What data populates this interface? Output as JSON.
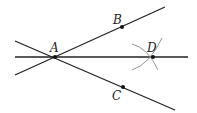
{
  "diagram": {
    "type": "geometry-construction",
    "colors": {
      "line": "#222222",
      "arc": "#888888",
      "point": "#111111",
      "background": "#ffffff"
    },
    "points": [
      {
        "id": "A",
        "label": "A",
        "x": 55,
        "y": 57,
        "lx": 50,
        "ly": 52
      },
      {
        "id": "B",
        "label": "B",
        "x": 122,
        "y": 27,
        "lx": 113,
        "ly": 24
      },
      {
        "id": "C",
        "label": "C",
        "x": 123,
        "y": 87,
        "lx": 112,
        "ly": 100
      },
      {
        "id": "D",
        "label": "D",
        "x": 153,
        "y": 57,
        "lx": 147,
        "ly": 52
      }
    ],
    "lines": [
      {
        "id": "line-AD",
        "x1": 15,
        "y1": 57,
        "x2": 188,
        "y2": 57
      },
      {
        "id": "ray-AB",
        "x1": 15,
        "y1": 75,
        "x2": 165,
        "y2": 7
      },
      {
        "id": "ray-AC",
        "x1": 15,
        "y1": 41,
        "x2": 175,
        "y2": 110
      }
    ],
    "arcs": [
      {
        "id": "arc-from-B",
        "d": "M 132 44 Q 148 48 158 70"
      },
      {
        "id": "arc-from-C",
        "d": "M 132 70 Q 150 64 162 38"
      }
    ]
  }
}
